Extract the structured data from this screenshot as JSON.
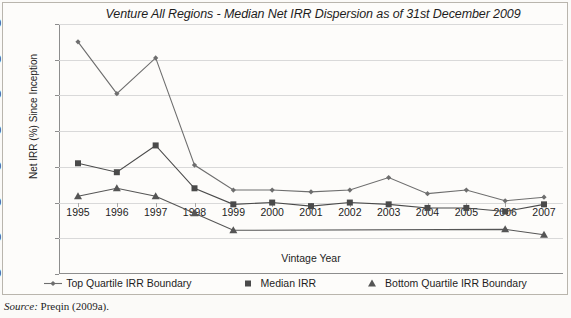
{
  "chart_data": {
    "type": "line",
    "title": "Venture All Regions - Median Net IRR Dispersion as of 31st December 2009",
    "xlabel": "Vintage Year",
    "ylabel": "Net IRR (%) Since Inception",
    "ylim": [
      -40,
      100
    ],
    "ytick_labels": [
      "100",
      "80",
      "60",
      "40",
      "20",
      "0",
      "-20",
      "-40"
    ],
    "yticks": [
      100,
      80,
      60,
      40,
      20,
      0,
      -20,
      -40
    ],
    "grid": true,
    "legend_position": "bottom",
    "categories": [
      "1995",
      "1996",
      "1997",
      "1998",
      "1999",
      "2000",
      "2001",
      "2002",
      "2003",
      "2004",
      "2005",
      "2006",
      "2007"
    ],
    "x": [
      1995,
      1996,
      1997,
      1998,
      1999,
      2000,
      2001,
      2002,
      2003,
      2004,
      2005,
      2006,
      2007
    ],
    "series": [
      {
        "name": "Top Quartile IRR Boundary",
        "marker": "diamond",
        "color": "#6e6e6e",
        "values": [
          90,
          61,
          81,
          21,
          7,
          7,
          6,
          7,
          14,
          5,
          7,
          1,
          3
        ]
      },
      {
        "name": "Median IRR",
        "marker": "square",
        "color": "#4a4a4a",
        "values": [
          22,
          17,
          32,
          8,
          -1,
          0,
          -2,
          0,
          -1,
          -3,
          -3,
          -5,
          -1
        ]
      },
      {
        "name": "Bottom Quartile IRR Boundary",
        "marker": "triangle",
        "color": "#555555",
        "values": [
          3.5,
          8,
          3.5,
          -6,
          -15.5,
          null,
          null,
          null,
          null,
          null,
          null,
          -15,
          -18
        ]
      }
    ]
  },
  "legend": {
    "items": [
      {
        "label": "Top Quartile IRR Boundary",
        "marker": "diamond"
      },
      {
        "label": "Median IRR",
        "marker": "square"
      },
      {
        "label": "Bottom Quartile IRR Boundary",
        "marker": "triangle"
      }
    ]
  },
  "source": {
    "prefix": "Source:",
    "text": "Preqin (2009a)."
  }
}
